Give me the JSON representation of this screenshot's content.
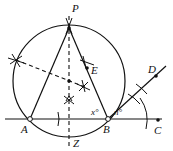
{
  "diagram": {
    "type": "geometric-construction",
    "stroke_color": "#111111",
    "background_color": "#ffffff",
    "points": {
      "P": "P",
      "A": "A",
      "B": "B",
      "C": "C",
      "D": "D",
      "E": "E",
      "Z": "Z"
    },
    "angle_labels": {
      "x": "x°",
      "n": "n°"
    }
  }
}
